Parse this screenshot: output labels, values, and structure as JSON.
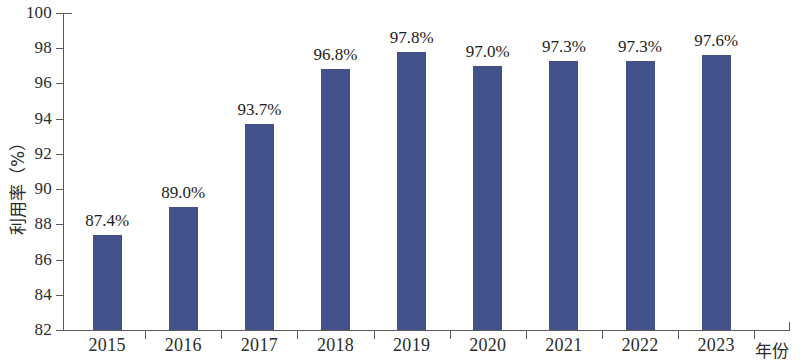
{
  "chart_data": {
    "type": "bar",
    "title": "",
    "xlabel": "年份",
    "ylabel": "利用率（%）",
    "categories": [
      "2015",
      "2016",
      "2017",
      "2018",
      "2019",
      "2020",
      "2021",
      "2022",
      "2023"
    ],
    "values": [
      87.4,
      89.0,
      93.7,
      96.8,
      97.8,
      97.0,
      97.3,
      97.3,
      97.6
    ],
    "data_labels": [
      "87.4%",
      "89.0%",
      "93.7%",
      "96.8%",
      "97.8%",
      "97.0%",
      "97.3%",
      "97.3%",
      "97.6%"
    ],
    "ylim": [
      82,
      100
    ],
    "y_ticks": [
      82,
      84,
      86,
      88,
      90,
      92,
      94,
      96,
      98,
      100
    ],
    "y_tick_labels": [
      "82",
      "84",
      "86",
      "88",
      "90",
      "92",
      "94",
      "96",
      "98",
      "100"
    ],
    "grid": false,
    "legend": false,
    "legend_position": "none",
    "series_color": "#44528c",
    "axis_color": "#5a5a5a",
    "text_color": "#2c2c2c",
    "background": "#ffffff"
  }
}
